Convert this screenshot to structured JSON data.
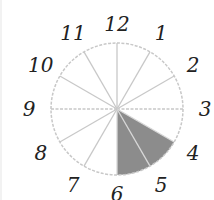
{
  "diagram": {
    "type": "clock-fraction",
    "numbers": [
      "12",
      "1",
      "2",
      "3",
      "4",
      "5",
      "6",
      "7",
      "8",
      "9",
      "10",
      "11"
    ],
    "divisions": 12,
    "shaded_from_hour": 4,
    "shaded_to_hour": 6,
    "colors": {
      "outline": "#c8c8c8",
      "shade": "#8c8c8c",
      "text": "#222222"
    }
  }
}
